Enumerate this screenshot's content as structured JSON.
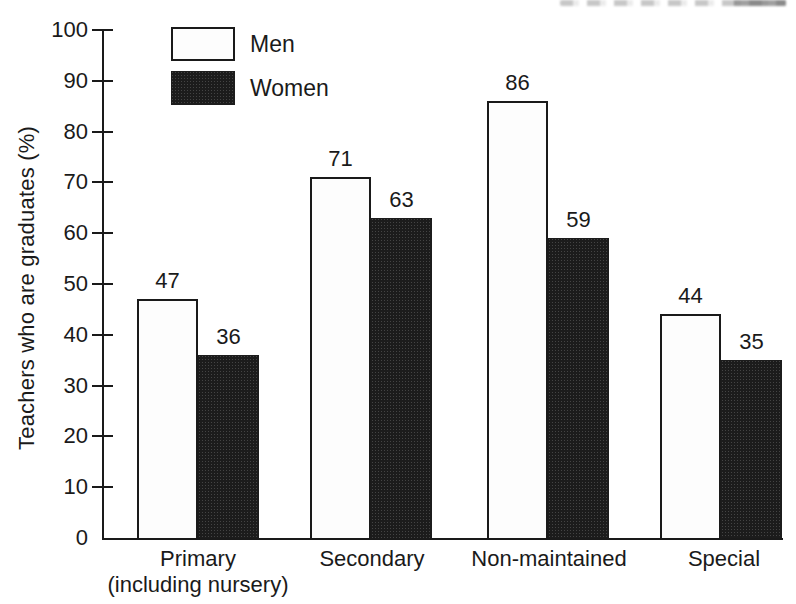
{
  "chart_data": {
    "type": "bar",
    "title": "",
    "xlabel": "",
    "ylabel": "Teachers who are graduates (%)",
    "ylim": [
      0,
      100
    ],
    "ytick_interval": 10,
    "yticks": [
      0,
      10,
      20,
      30,
      40,
      50,
      60,
      70,
      80,
      90,
      100
    ],
    "grid": false,
    "bar_value_labels": true,
    "legend_position": "top-left",
    "categories": [
      "Primary (including nursery)",
      "Secondary",
      "Non-maintained",
      "Special"
    ],
    "category_display_lines": [
      [
        "Primary",
        "(including nursery)"
      ],
      [
        "Secondary"
      ],
      [
        "Non-maintained"
      ],
      [
        "Special"
      ]
    ],
    "series": [
      {
        "name": "Men",
        "values": [
          47,
          71,
          86,
          44
        ],
        "fill": "#fdfdfd",
        "stroke": "#1a1a1a"
      },
      {
        "name": "Women",
        "values": [
          36,
          63,
          59,
          35
        ],
        "fill": "#1c1c1c",
        "stroke": "#1c1c1c"
      }
    ],
    "axis_color": "#1a1a1a",
    "text_color": "#1a1a1a",
    "background_color": "#ffffff"
  }
}
